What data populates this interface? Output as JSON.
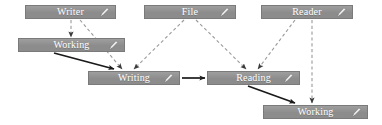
{
  "diagram": {
    "colors": {
      "node_fill": "#8c8c8c",
      "node_border": "#7a7a7a",
      "node_text": "#ffffff",
      "solid_edge": "#1a1a1a",
      "dashed_edge": "#9a9a9a",
      "background": "#ffffff"
    },
    "nodes": [
      {
        "id": "writer",
        "label": "Writer",
        "icon": "pencil-icon",
        "x": 25,
        "y": 5,
        "w": 91,
        "h": 14
      },
      {
        "id": "file",
        "label": "File",
        "icon": "pencil-icon",
        "x": 144,
        "y": 5,
        "w": 92,
        "h": 14
      },
      {
        "id": "reader",
        "label": "Reader",
        "icon": "pencil-icon",
        "x": 261,
        "y": 5,
        "w": 92,
        "h": 14
      },
      {
        "id": "working-top",
        "label": "Working",
        "icon": "pencil-icon",
        "x": 18,
        "y": 38,
        "w": 107,
        "h": 14
      },
      {
        "id": "writing",
        "label": "Writing",
        "icon": "pencil-icon",
        "x": 88,
        "y": 71,
        "w": 92,
        "h": 14
      },
      {
        "id": "reading",
        "label": "Reading",
        "icon": "pencil-icon",
        "x": 207,
        "y": 71,
        "w": 93,
        "h": 14
      },
      {
        "id": "working-bot",
        "label": "Working",
        "icon": "pencil-icon",
        "x": 263,
        "y": 105,
        "w": 105,
        "h": 14
      }
    ],
    "edges": [
      {
        "id": "writer-to-working-top",
        "from": "writer",
        "to": "working-top",
        "style": "dashed",
        "x1": 71,
        "y1": 20,
        "x2": 71,
        "y2": 37
      },
      {
        "id": "writer-to-writing",
        "from": "writer",
        "to": "writing",
        "style": "dashed",
        "x1": 80,
        "y1": 20,
        "x2": 122,
        "y2": 69
      },
      {
        "id": "file-to-writing",
        "from": "file",
        "to": "writing",
        "style": "dashed",
        "x1": 184,
        "y1": 20,
        "x2": 134,
        "y2": 69
      },
      {
        "id": "file-to-reading",
        "from": "file",
        "to": "reading",
        "style": "dashed",
        "x1": 196,
        "y1": 20,
        "x2": 246,
        "y2": 69
      },
      {
        "id": "reader-to-reading",
        "from": "reader",
        "to": "reading",
        "style": "dashed",
        "x1": 295,
        "y1": 20,
        "x2": 258,
        "y2": 69
      },
      {
        "id": "reader-to-working-bot",
        "from": "reader",
        "to": "working-bot",
        "style": "dashed",
        "x1": 312,
        "y1": 20,
        "x2": 312,
        "y2": 103
      },
      {
        "id": "working-top-to-writing",
        "from": "working-top",
        "to": "writing",
        "style": "solid",
        "x1": 54,
        "y1": 53,
        "x2": 114,
        "y2": 69
      },
      {
        "id": "writing-to-reading",
        "from": "writing",
        "to": "reading",
        "style": "solid",
        "x1": 182,
        "y1": 78,
        "x2": 205,
        "y2": 78
      },
      {
        "id": "reading-to-working-bot",
        "from": "reading",
        "to": "working-bot",
        "style": "solid",
        "x1": 248,
        "y1": 86,
        "x2": 295,
        "y2": 103
      }
    ]
  }
}
